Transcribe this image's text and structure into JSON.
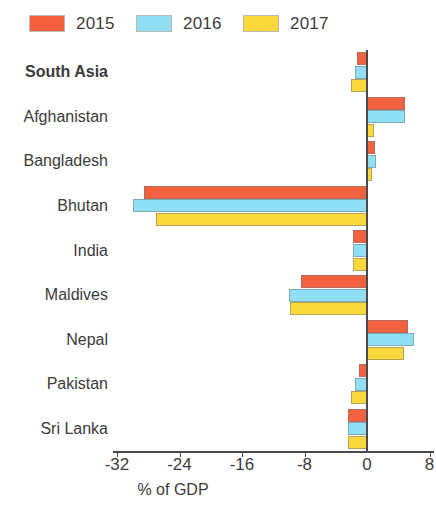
{
  "chart_data": {
    "type": "bar",
    "orientation": "horizontal",
    "title": "",
    "subtitle": "",
    "xlabel": "% of GDP",
    "ylabel": "",
    "xlim": [
      -36.5,
      10.5
    ],
    "xticks": [
      -32,
      -24,
      -16,
      -8,
      0,
      8
    ],
    "xtick_labels": [
      "-32",
      "-24",
      "-16",
      "-8",
      "0",
      "8"
    ],
    "grid": false,
    "legend_position": "top-left",
    "categories": [
      "South Asia",
      "Afghanistan",
      "Bangladesh",
      "Bhutan",
      "India",
      "Maldives",
      "Nepal",
      "Pakistan",
      "Sri Lanka"
    ],
    "emphasized_categories": [
      "South Asia"
    ],
    "series": [
      {
        "name": "2015",
        "color": "#F4613F",
        "values": [
          -1.3,
          4.9,
          1.0,
          -28.5,
          -1.8,
          -8.5,
          5.2,
          -1.0,
          -2.4
        ]
      },
      {
        "name": "2016",
        "color": "#8FE0F5",
        "values": [
          -1.6,
          4.9,
          1.2,
          -30.0,
          -1.8,
          -10.0,
          6.0,
          -1.5,
          -2.4
        ]
      },
      {
        "name": "2017",
        "color": "#FCD93A",
        "values": [
          -2.0,
          0.9,
          0.6,
          -27.0,
          -1.8,
          -9.8,
          4.7,
          -2.0,
          -2.4
        ]
      }
    ]
  },
  "legend": {
    "items": [
      {
        "label": "2015",
        "color": "#F4613F"
      },
      {
        "label": "2016",
        "color": "#8FE0F5"
      },
      {
        "label": "2017",
        "color": "#FCD93A"
      }
    ]
  },
  "axis": {
    "x_title": "% of GDP"
  }
}
